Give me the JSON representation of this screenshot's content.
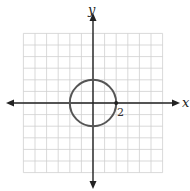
{
  "diagram": {
    "type": "coordinate-plane-graph",
    "x_axis_label": "x",
    "y_axis_label": "y",
    "grid": {
      "columns": 12,
      "rows": 12,
      "x_range": [
        -6,
        6
      ],
      "y_range": [
        -6,
        6
      ]
    },
    "curve": {
      "shape": "circle",
      "center": [
        0,
        0
      ],
      "radius": 2
    },
    "point": {
      "x": 2,
      "y": 0
    },
    "point_label": "2",
    "colors": {
      "grid": "#cfcfcf",
      "axis": "#222222",
      "curve": "#555555"
    }
  }
}
